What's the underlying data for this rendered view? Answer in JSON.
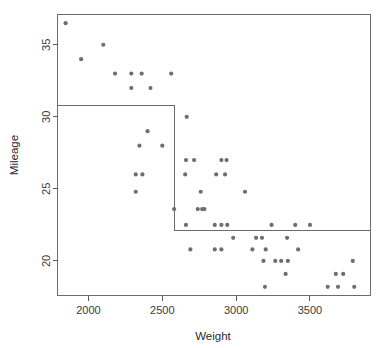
{
  "chart_data": {
    "type": "scatter",
    "title": "",
    "subtitle": "",
    "xlabel": "Weight",
    "ylabel": "Mileage",
    "xlim": [
      1790,
      3910
    ],
    "ylim": [
      17.6,
      37.1
    ],
    "xticks": [
      2000,
      2500,
      3000,
      3500
    ],
    "yticks": [
      20,
      25,
      30,
      35
    ],
    "xtick_labels": [
      "2000",
      "2500",
      "3000",
      "3500"
    ],
    "ytick_labels": [
      "20",
      "25",
      "30",
      "35"
    ],
    "grid": false,
    "legend": "none",
    "point_color": "#6e6e6e",
    "line_color": "#6b6b6b",
    "frame_color": "#6b6b6b",
    "point_radius": 2.1,
    "series": [
      {
        "name": "cars",
        "points": [
          [
            1845,
            36.5
          ],
          [
            1950,
            34
          ],
          [
            2100,
            35
          ],
          [
            2180,
            33
          ],
          [
            2290,
            33
          ],
          [
            2290,
            32
          ],
          [
            2360,
            33
          ],
          [
            2420,
            32
          ],
          [
            2560,
            33
          ],
          [
            2320,
            26
          ],
          [
            2365,
            26
          ],
          [
            2320,
            24.8
          ],
          [
            2400,
            29
          ],
          [
            2345,
            28
          ],
          [
            2500,
            28
          ],
          [
            2580,
            23.6
          ],
          [
            2665,
            30
          ],
          [
            2660,
            27
          ],
          [
            2715,
            27
          ],
          [
            2655,
            26
          ],
          [
            2760,
            24.8
          ],
          [
            2740,
            23.6
          ],
          [
            2770,
            23.6
          ],
          [
            2785,
            23.6
          ],
          [
            2660,
            22.5
          ],
          [
            2865,
            26
          ],
          [
            2900,
            27
          ],
          [
            2935,
            27
          ],
          [
            2925,
            26
          ],
          [
            2855,
            22.5
          ],
          [
            2900,
            22.5
          ],
          [
            2940,
            22.5
          ],
          [
            3060,
            24.8
          ],
          [
            3240,
            22.5
          ],
          [
            3400,
            22.5
          ],
          [
            3500,
            22.5
          ],
          [
            2980,
            21.6
          ],
          [
            3135,
            21.6
          ],
          [
            3175,
            21.6
          ],
          [
            3345,
            21.6
          ],
          [
            2690,
            20.8
          ],
          [
            2855,
            20.8
          ],
          [
            2900,
            20.8
          ],
          [
            3110,
            20.8
          ],
          [
            3200,
            20.8
          ],
          [
            3420,
            20.8
          ],
          [
            3185,
            20
          ],
          [
            3265,
            20
          ],
          [
            3305,
            20
          ],
          [
            3350,
            20
          ],
          [
            3790,
            20
          ],
          [
            3335,
            19.1
          ],
          [
            3675,
            19.1
          ],
          [
            3725,
            19.1
          ],
          [
            3195,
            18.2
          ],
          [
            3620,
            18.2
          ],
          [
            3690,
            18.2
          ],
          [
            3800,
            18.2
          ]
        ]
      }
    ],
    "partition_step": {
      "description": "regression-tree partition boundary",
      "segments": [
        {
          "from": [
            1790,
            30.8
          ],
          "to": [
            2580,
            30.8
          ]
        },
        {
          "from": [
            2580,
            30.8
          ],
          "to": [
            2580,
            22.1
          ]
        },
        {
          "from": [
            2580,
            22.1
          ],
          "to": [
            3910,
            22.1
          ]
        }
      ]
    }
  }
}
